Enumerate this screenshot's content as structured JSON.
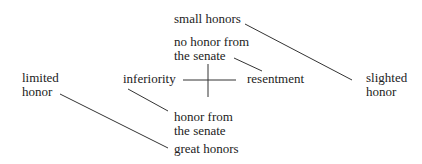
{
  "diagram": {
    "type": "semiotic-square",
    "nodes": {
      "small_honors": {
        "lines": [
          "small honors"
        ]
      },
      "no_honor_from_senate": {
        "lines": [
          "no honor from",
          "the senate"
        ]
      },
      "limited_honor": {
        "lines": [
          "limited",
          "honor"
        ]
      },
      "inferiority": {
        "lines": [
          "inferiority"
        ]
      },
      "resentment": {
        "lines": [
          "resentment"
        ]
      },
      "slighted_honor": {
        "lines": [
          "slighted",
          "honor"
        ]
      },
      "honor_from_senate": {
        "lines": [
          "honor from",
          "the senate"
        ]
      },
      "great_honors": {
        "lines": [
          "great honors"
        ]
      }
    },
    "edges": [
      {
        "from": "small honors",
        "to": "slighted honor"
      },
      {
        "from": "no honor from the senate",
        "to": "resentment"
      },
      {
        "from": "limited honor",
        "to": "great honors"
      },
      {
        "from": "inferiority",
        "to": "honor from the senate"
      },
      {
        "from": "inferiority",
        "to": "resentment",
        "style": "cross-horizontal"
      },
      {
        "from": "no honor from the senate",
        "to": "honor from the senate",
        "style": "cross-vertical"
      }
    ],
    "colors": {
      "text": "#222222",
      "line": "#333333",
      "background": "#ffffff"
    }
  }
}
